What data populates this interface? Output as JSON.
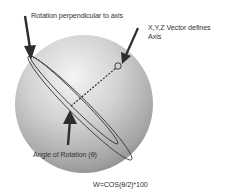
{
  "diagram": {
    "labels": {
      "rotation_perpendicular": "Rotation perpendicular to axis",
      "vector_line1": "X,Y,Z Vector defines",
      "vector_line2": "Axis",
      "angle_of_rotation": "Angle of Rotation (θ)",
      "formula": "W=COS(θ/2)*100"
    },
    "colors": {
      "sphere_light": "#f2f2f2",
      "sphere_mid": "#c8c8c8",
      "sphere_dark": "#8a8a8a",
      "lines": "#3a3a3a",
      "arrows": "#2e2e2e",
      "text": "#333333"
    },
    "sphere": {
      "cx": 84,
      "cy": 104,
      "r": 69
    }
  }
}
